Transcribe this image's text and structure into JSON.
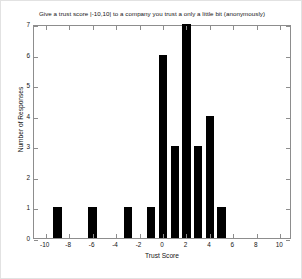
{
  "chart_data": {
    "type": "bar",
    "title": "Give a trust score |-10,10| to a company you trust a only a little bit  (anonymously)",
    "xlabel": "Trust Score",
    "ylabel": "Number of Responses",
    "xlim": [
      -11,
      11
    ],
    "ylim": [
      0,
      7
    ],
    "xticks": [
      -10,
      -8,
      -6,
      -4,
      -2,
      0,
      2,
      4,
      6,
      8,
      10
    ],
    "xtick_labels": [
      "-10",
      "-8",
      "-6",
      "-4",
      "-2",
      "0",
      "2",
      "4",
      "6",
      "8",
      "10"
    ],
    "yticks": [
      0,
      1,
      2,
      3,
      4,
      5,
      6,
      7
    ],
    "ytick_labels": [
      "0",
      "1",
      "2",
      "3",
      "4",
      "5",
      "6",
      "7"
    ],
    "grid": false,
    "legend": null,
    "bar_color": "#000000",
    "bar_width": 0.72,
    "categories": [
      -9,
      -6,
      -3,
      -1,
      0,
      1,
      2,
      3,
      4,
      5
    ],
    "values": [
      1,
      1,
      1,
      1,
      6,
      3,
      7,
      3,
      4,
      1
    ],
    "series": [
      {
        "name": "Number of Responses",
        "x": [
          -9,
          -6,
          -3,
          -1,
          0,
          1,
          2,
          3,
          4,
          5
        ],
        "values": [
          1,
          1,
          1,
          1,
          6,
          3,
          7,
          3,
          4,
          1
        ]
      }
    ]
  },
  "figure": {
    "background": "#ffffff",
    "axes_color": "#8d8d8d",
    "text_color": "#141414"
  }
}
